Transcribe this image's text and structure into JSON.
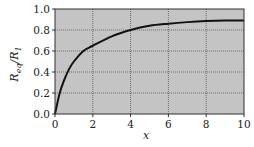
{
  "chart_data": {
    "type": "line",
    "title": "",
    "xlabel": "x",
    "ylabel": "R_eq/R_1",
    "xlim": [
      0,
      10
    ],
    "ylim": [
      0.0,
      1.0
    ],
    "x_ticks": [
      "0",
      "2",
      "4",
      "6",
      "8",
      "10"
    ],
    "y_ticks": [
      "0.0",
      "0.2",
      "0.4",
      "0.6",
      "0.8",
      "1.0"
    ],
    "grid": true,
    "legend": null,
    "series": [
      {
        "name": "R_eq/R_1",
        "x": [
          0,
          0.25,
          0.5,
          0.75,
          1,
          1.5,
          2,
          3,
          4,
          5,
          6,
          7,
          8,
          9,
          10
        ],
        "values": [
          0,
          0.2,
          0.33,
          0.43,
          0.5,
          0.6,
          0.65,
          0.74,
          0.8,
          0.84,
          0.86,
          0.875,
          0.885,
          0.89,
          0.89
        ]
      }
    ]
  },
  "colors": {
    "plot_background": "#c4c4c4",
    "grid": "#555555",
    "curve": "#111111",
    "frame": "#333333"
  },
  "labels": {
    "xlabel": "x",
    "ylabel_main": "R",
    "ylabel_sub1": "eq",
    "ylabel_mid": "/R",
    "ylabel_sub2": "1"
  }
}
